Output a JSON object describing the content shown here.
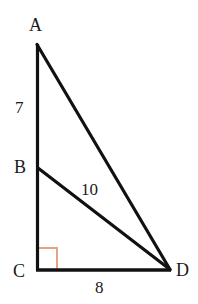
{
  "figure": {
    "kind": "geometry-diagram",
    "background_color": "#ffffff",
    "stroke_color": "#111111",
    "stroke_width": 3,
    "right_angle_marker_color": "#e8a183",
    "vertex_labels": [
      {
        "id": "A",
        "text": "A",
        "x": 36,
        "y": 44
      },
      {
        "id": "B",
        "text": "B",
        "x": 37,
        "y": 168
      },
      {
        "id": "C",
        "text": "C",
        "x": 37,
        "y": 270
      },
      {
        "id": "D",
        "text": "D",
        "x": 170,
        "y": 270
      }
    ],
    "side_measures": [
      {
        "id": "AB",
        "text": "7",
        "segment": "A-B"
      },
      {
        "id": "BD",
        "text": "10",
        "segment": "B-D"
      },
      {
        "id": "CD",
        "text": "8",
        "segment": "C-D"
      }
    ],
    "segments": [
      {
        "id": "AC",
        "from": "A",
        "to": "C"
      },
      {
        "id": "AD",
        "from": "A",
        "to": "D"
      },
      {
        "id": "BD",
        "from": "B",
        "to": "D"
      },
      {
        "id": "CD",
        "from": "C",
        "to": "D"
      }
    ],
    "right_angle_at": "C"
  }
}
